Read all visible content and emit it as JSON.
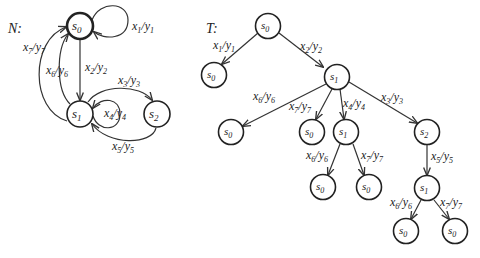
{
  "graph_N": {
    "title": "N:",
    "nodes": [
      {
        "id": "n_s0",
        "label": "s",
        "sub": "0",
        "x": 80,
        "y": 26,
        "initial": true
      },
      {
        "id": "n_s1",
        "label": "s",
        "sub": "1",
        "x": 80,
        "y": 114
      },
      {
        "id": "n_s2",
        "label": "s",
        "sub": "2",
        "x": 157,
        "y": 114
      }
    ],
    "edges": [
      {
        "from": "s0",
        "to": "s0",
        "x": "x",
        "xs": "1",
        "y": "y",
        "ys": "1"
      },
      {
        "from": "s0",
        "to": "s1",
        "x": "x",
        "xs": "2",
        "y": "y",
        "ys": "2"
      },
      {
        "from": "s1",
        "to": "s2",
        "x": "x",
        "xs": "3",
        "y": "y",
        "ys": "3"
      },
      {
        "from": "s1",
        "to": "s1",
        "x": "x",
        "xs": "4",
        "y": "y",
        "ys": "4"
      },
      {
        "from": "s2",
        "to": "s1",
        "x": "x",
        "xs": "5",
        "y": "y",
        "ys": "5"
      },
      {
        "from": "s1",
        "to": "s0",
        "x": "x",
        "xs": "6",
        "y": "y",
        "ys": "6"
      },
      {
        "from": "s1",
        "to": "s0",
        "x": "x",
        "xs": "7",
        "y": "y",
        "ys": "7"
      }
    ]
  },
  "tree_T": {
    "title": "T:",
    "nodes": [
      {
        "id": "t0",
        "sub": "0"
      },
      {
        "id": "t1",
        "sub": "0"
      },
      {
        "id": "t2",
        "sub": "1"
      },
      {
        "id": "t3",
        "sub": "0"
      },
      {
        "id": "t4",
        "sub": "0"
      },
      {
        "id": "t5",
        "sub": "1"
      },
      {
        "id": "t6",
        "sub": "2"
      },
      {
        "id": "t7",
        "sub": "0"
      },
      {
        "id": "t8",
        "sub": "0"
      },
      {
        "id": "t9",
        "sub": "1"
      },
      {
        "id": "t10",
        "sub": "0"
      },
      {
        "id": "t11",
        "sub": "0"
      }
    ],
    "edges": [
      {
        "from": "t0",
        "to": "t1",
        "xs": "1",
        "ys": "1"
      },
      {
        "from": "t0",
        "to": "t2",
        "xs": "2",
        "ys": "2"
      },
      {
        "from": "t2",
        "to": "t3",
        "xs": "6",
        "ys": "6"
      },
      {
        "from": "t2",
        "to": "t4",
        "xs": "7",
        "ys": "7"
      },
      {
        "from": "t2",
        "to": "t5",
        "xs": "4",
        "ys": "4"
      },
      {
        "from": "t2",
        "to": "t6",
        "xs": "3",
        "ys": "3"
      },
      {
        "from": "t5",
        "to": "t7",
        "xs": "6",
        "ys": "6"
      },
      {
        "from": "t5",
        "to": "t8",
        "xs": "7",
        "ys": "7"
      },
      {
        "from": "t6",
        "to": "t9",
        "xs": "5",
        "ys": "5"
      },
      {
        "from": "t9",
        "to": "t10",
        "xs": "6",
        "ys": "6"
      },
      {
        "from": "t9",
        "to": "t11",
        "xs": "7",
        "ys": "7"
      }
    ]
  },
  "glyphs": {
    "state": "s",
    "input": "x",
    "output": "y",
    "sep": "/"
  }
}
